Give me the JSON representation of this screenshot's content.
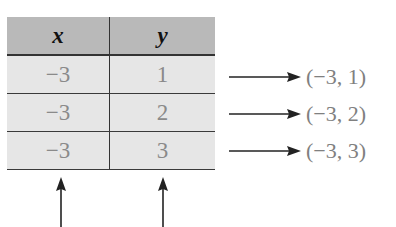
{
  "table": {
    "headers": [
      "x",
      "y"
    ],
    "rows": [
      {
        "x": "−3",
        "y": "1"
      },
      {
        "x": "−3",
        "y": "2"
      },
      {
        "x": "−3",
        "y": "3"
      }
    ]
  },
  "pairs": [
    "(−3, 1)",
    "(−3, 2)",
    "(−3, 3)"
  ],
  "colors": {
    "header_bg": "#b9b9b9",
    "row_bg": "#e6e6e6",
    "value_text": "#8a8a8a"
  }
}
